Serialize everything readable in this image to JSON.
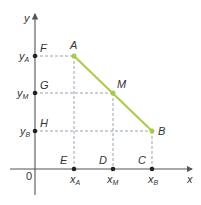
{
  "diagram": {
    "axes": {
      "x_label": "x",
      "y_label": "y",
      "origin_label": "0",
      "color": "#555555"
    },
    "segment": {
      "from": "A",
      "to": "B",
      "color": "#a8cc4a"
    },
    "points": {
      "A": {
        "label": "A"
      },
      "M": {
        "label": "M"
      },
      "B": {
        "label": "B"
      },
      "F": {
        "label": "F"
      },
      "G": {
        "label": "G"
      },
      "H": {
        "label": "H"
      },
      "E": {
        "label": "E"
      },
      "D": {
        "label": "D"
      },
      "C": {
        "label": "C"
      }
    },
    "y_ticks": [
      {
        "main": "y",
        "sub": "A"
      },
      {
        "main": "y",
        "sub": "M"
      },
      {
        "main": "y",
        "sub": "B"
      }
    ],
    "x_ticks": [
      {
        "main": "x",
        "sub": "A"
      },
      {
        "main": "x",
        "sub": "M"
      },
      {
        "main": "x",
        "sub": "B"
      }
    ],
    "guide_color": "#8a9aaa"
  }
}
